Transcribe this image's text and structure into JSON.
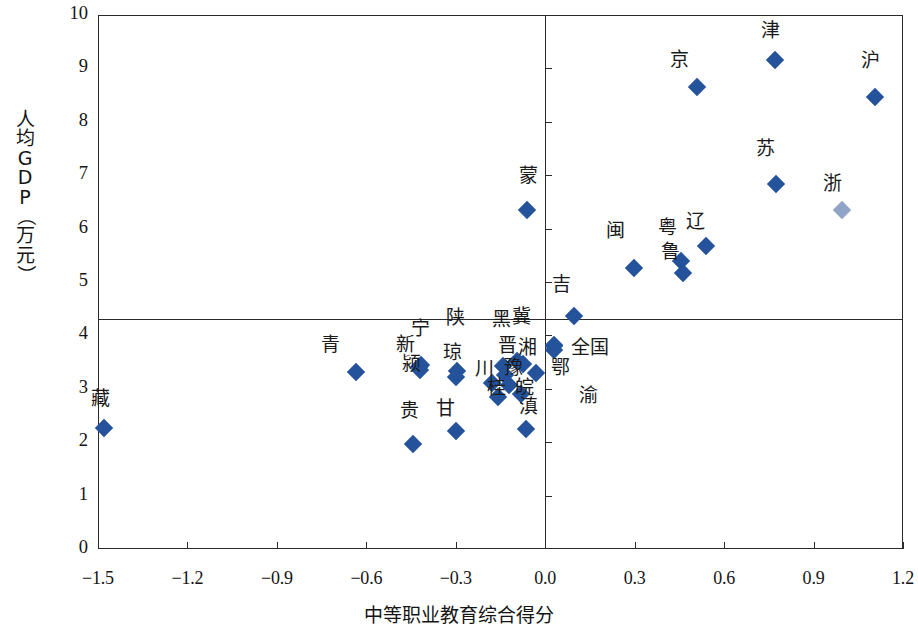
{
  "chart_data": {
    "type": "scatter",
    "title": "",
    "xlabel": "中等职业教育综合得分",
    "ylabel": "人均GDP（万元）",
    "ylabel_chars": [
      "人",
      "均",
      "G",
      "D",
      "P",
      "（",
      "万",
      "元",
      "）"
    ],
    "xlim": [
      -1.5,
      1.2
    ],
    "ylim": [
      0,
      10
    ],
    "xticks": [
      "-1.5",
      "-1.2",
      "-0.9",
      "-0.6",
      "-0.3",
      "0.0",
      "0.3",
      "0.6",
      "0.9",
      "1.2"
    ],
    "xtick_values": [
      -1.5,
      -1.2,
      -0.9,
      -0.6,
      -0.3,
      0.0,
      0.3,
      0.6,
      0.9,
      1.2
    ],
    "yticks": [
      "0",
      "1",
      "2",
      "3",
      "4",
      "5",
      "6",
      "7",
      "8",
      "9",
      "10"
    ],
    "ytick_values": [
      0,
      1,
      2,
      3,
      4,
      5,
      6,
      7,
      8,
      9,
      10
    ],
    "grid": false,
    "legend": "none",
    "reference_lines": {
      "horizontal_y": 4.3,
      "vertical_x": 0.0
    },
    "marker_color": "#24539c",
    "marker_shape": "diamond",
    "points": [
      {
        "label": "藏",
        "x": -1.48,
        "y": 2.26,
        "lx": -1.49,
        "ly": 2.86
      },
      {
        "label": "青",
        "x": -0.635,
        "y": 3.31,
        "lx": -0.72,
        "ly": 3.88
      },
      {
        "label": "贵",
        "x": -0.445,
        "y": 1.97,
        "lx": -0.455,
        "ly": 2.64
      },
      {
        "label": "新",
        "x": -0.425,
        "y": 3.4,
        "lx": -0.47,
        "ly": 3.88
      },
      {
        "label": "宁",
        "x": -0.415,
        "y": 3.45,
        "lx": -0.42,
        "ly": 4.18
      },
      {
        "label": "颍",
        "x": -0.42,
        "y": 3.35,
        "lx": -0.448,
        "ly": 3.52
      },
      {
        "label": "甘",
        "x": -0.3,
        "y": 2.21,
        "lx": -0.335,
        "ly": 2.68
      },
      {
        "label": "琼",
        "x": -0.3,
        "y": 3.22,
        "lx": -0.31,
        "ly": 3.72
      },
      {
        "label": "陕",
        "x": -0.295,
        "y": 3.33,
        "lx": -0.3,
        "ly": 4.38
      },
      {
        "label": "川",
        "x": -0.18,
        "y": 3.1,
        "lx": -0.205,
        "ly": 3.42
      },
      {
        "label": "桂",
        "x": -0.16,
        "y": 2.85,
        "lx": -0.165,
        "ly": 3.08
      },
      {
        "label": "黑",
        "x": -0.14,
        "y": 3.42,
        "lx": -0.148,
        "ly": 4.35
      },
      {
        "label": "晋",
        "x": -0.135,
        "y": 3.25,
        "lx": -0.128,
        "ly": 3.86
      },
      {
        "label": "豫",
        "x": -0.12,
        "y": 3.07,
        "lx": -0.105,
        "ly": 3.44
      },
      {
        "label": "冀",
        "x": -0.095,
        "y": 3.52,
        "lx": -0.08,
        "ly": 4.4
      },
      {
        "label": "皖",
        "x": -0.08,
        "y": 2.9,
        "lx": -0.07,
        "ly": 3.07
      },
      {
        "label": "湘",
        "x": -0.075,
        "y": 3.46,
        "lx": -0.058,
        "ly": 3.82
      },
      {
        "label": "滇",
        "x": -0.065,
        "y": 2.24,
        "lx": -0.057,
        "ly": 2.72
      },
      {
        "label": "蒙",
        "x": -0.06,
        "y": 6.35,
        "lx": -0.055,
        "ly": 7.05
      },
      {
        "label": "湘2",
        "x": -0.03,
        "y": 3.3,
        "lx": null,
        "ly": null
      },
      {
        "label": "吉",
        "x": 0.095,
        "y": 4.37,
        "lx": 0.055,
        "ly": 5.0
      },
      {
        "label": "鄂",
        "x": 0.03,
        "y": 3.82,
        "lx": 0.05,
        "ly": 3.45
      },
      {
        "label": "全国",
        "x": 0.03,
        "y": 3.8,
        "lx": 0.15,
        "ly": 3.82
      },
      {
        "label": "渝",
        "x": 0.03,
        "y": 3.72,
        "lx": 0.145,
        "ly": 2.92
      },
      {
        "label": "闽",
        "x": 0.298,
        "y": 5.27,
        "lx": 0.235,
        "ly": 6.02
      },
      {
        "label": "粤",
        "x": 0.455,
        "y": 5.4,
        "lx": 0.41,
        "ly": 6.06
      },
      {
        "label": "鲁",
        "x": 0.462,
        "y": 5.17,
        "lx": 0.42,
        "ly": 5.62
      },
      {
        "label": "辽",
        "x": 0.54,
        "y": 5.68,
        "lx": 0.505,
        "ly": 6.18
      },
      {
        "label": "京",
        "x": 0.51,
        "y": 8.65,
        "lx": 0.45,
        "ly": 9.22
      },
      {
        "label": "津",
        "x": 0.77,
        "y": 9.15,
        "lx": 0.755,
        "ly": 9.75
      },
      {
        "label": "苏",
        "x": 0.775,
        "y": 6.84,
        "lx": 0.74,
        "ly": 7.55
      },
      {
        "label": "浙",
        "x": 0.995,
        "y": 6.35,
        "lx": 0.965,
        "ly": 6.9
      },
      {
        "label": "沪",
        "x": 1.105,
        "y": 8.47,
        "lx": 1.09,
        "ly": 9.2
      }
    ],
    "faded_points": [
      "浙"
    ]
  }
}
